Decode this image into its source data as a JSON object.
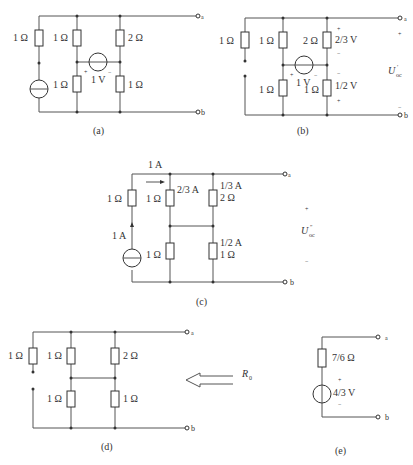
{
  "figures": [
    {
      "id": "a",
      "caption": "(a)",
      "terminals": [
        "a",
        "b"
      ],
      "components": {
        "r_left": "1 Ω",
        "r_mid_top": "1 Ω",
        "r_mid_bot": "1 Ω",
        "r_right_top": "2 Ω",
        "r_right_bot": "1 Ω",
        "vsource": "1 V",
        "vsource_plus": "+",
        "vsource_minus": "−"
      }
    },
    {
      "id": "b",
      "caption": "(b)",
      "terminals": [
        "a",
        "b"
      ],
      "components": {
        "r_left": "1 Ω",
        "r_mid_top": "1 Ω",
        "r_mid_bot": "1 Ω",
        "r_right_top": "2 Ω",
        "r_right_bot": "1 Ω",
        "vsource": "1 V",
        "vsource_plus": "+",
        "vsource_minus": "−",
        "v_right_top": "2/3 V",
        "v_right_top_plus": "+",
        "v_right_top_minus": "−",
        "v_right_bot": "1/2 V",
        "v_right_bot_minus": "−",
        "v_right_bot_plus": "+",
        "uoc_label": "U",
        "uoc_sub": "oc",
        "uoc_sup": "′",
        "uoc_plus": "+",
        "uoc_minus": "−"
      }
    },
    {
      "id": "c",
      "caption": "(c)",
      "terminals": [
        "a",
        "b"
      ],
      "components": {
        "r_left": "1 Ω",
        "r_mid_top": "1 Ω",
        "r_mid_bot": "1 Ω",
        "r_right_top": "2 Ω",
        "r_right_bot": "1 Ω",
        "i_top": "1 A",
        "i_source": "1 A",
        "i_mid_top": "2/3 A",
        "i_right_top": "1/3 A",
        "i_right_bot": "1/2 A",
        "uoc_label": "U",
        "uoc_sub": "oc",
        "uoc_sup": "″",
        "uoc_plus": "+",
        "uoc_minus": "−"
      }
    },
    {
      "id": "d",
      "caption": "(d)",
      "terminals": [
        "a",
        "b"
      ],
      "components": {
        "r_left": "1 Ω",
        "r_mid_top": "1 Ω",
        "r_mid_bot": "1 Ω",
        "r_right_top": "2 Ω",
        "r_right_bot": "1 Ω",
        "r0_label": "R",
        "r0_sub": "0"
      }
    },
    {
      "id": "e",
      "caption": "(e)",
      "terminals": [
        "a",
        "b"
      ],
      "components": {
        "r_series": "7/6 Ω",
        "vsource": "4/3 V",
        "vsource_plus": "+",
        "vsource_minus": "−"
      }
    }
  ]
}
